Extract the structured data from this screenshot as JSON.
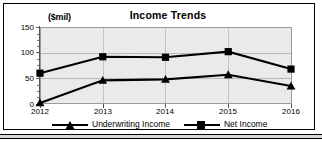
{
  "chart_data": {
    "type": "line",
    "title": "Income Trends",
    "xlabel": "",
    "ylabel": "($mil)",
    "unit_label": "($mil)",
    "categories": [
      "2012",
      "2013",
      "2014",
      "2015",
      "2016"
    ],
    "x": [
      2012,
      2013,
      2014,
      2015,
      2016
    ],
    "ylim": [
      0,
      150
    ],
    "yticks": [
      0,
      50,
      100,
      150
    ],
    "ytick_labels": [
      "0",
      "50",
      "100",
      "150"
    ],
    "grid": true,
    "legend_position": "bottom",
    "series": [
      {
        "name": "Underwriting Income",
        "marker": "triangle",
        "color": "#000000",
        "values": [
          2,
          46,
          48,
          57,
          35
        ]
      },
      {
        "name": "Net Income",
        "marker": "square",
        "color": "#000000",
        "values": [
          60,
          92,
          91,
          102,
          68
        ]
      }
    ]
  },
  "legend": {
    "entries": [
      {
        "label": "Underwriting Income",
        "marker": "triangle-marker"
      },
      {
        "label": "Net Income",
        "marker": "square-marker"
      }
    ]
  },
  "colors": {
    "plot_background": "#eaeaea",
    "series_line": "#000000",
    "gridline": "#b9b9b9",
    "frame_border": "#000000"
  }
}
